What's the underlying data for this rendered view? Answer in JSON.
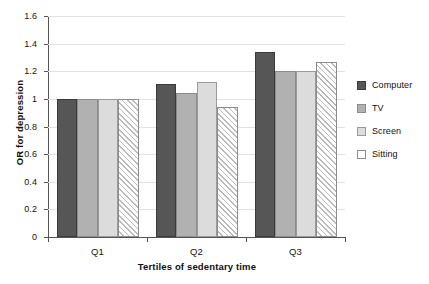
{
  "chart_data": {
    "type": "bar",
    "title": "",
    "subtitle": "",
    "xlabel": "Tertiles of sedentary time",
    "ylabel": "OR for depression",
    "categories": [
      "Q1",
      "Q2",
      "Q3"
    ],
    "series": [
      {
        "name": "Computer",
        "color": "#565656",
        "fill": "solid-dark-gray",
        "values": [
          1.0,
          1.11,
          1.34
        ]
      },
      {
        "name": "TV",
        "color": "#b1b1b1",
        "fill": "solid-medium-gray",
        "values": [
          1.0,
          1.04,
          1.2
        ]
      },
      {
        "name": "Screen",
        "color": "#dcdcdc",
        "fill": "solid-light-gray",
        "values": [
          1.0,
          1.12,
          1.2
        ]
      },
      {
        "name": "Sitting",
        "color": "#ffffff",
        "fill": "diagonal-hatch",
        "values": [
          1.0,
          0.94,
          1.27
        ]
      }
    ],
    "ylim": [
      0,
      1.6
    ],
    "ytick_labels": [
      "0",
      "0.2",
      "0.4",
      "0.6",
      "0.8",
      "1",
      "1.2",
      "1.4",
      "1.6"
    ],
    "ytick_values": [
      0,
      0.2,
      0.4,
      0.6,
      0.8,
      1.0,
      1.2,
      1.4,
      1.6
    ],
    "grid": "horizontal",
    "legend_position": "right",
    "legend_entries": [
      "Computer",
      "TV",
      "Screen",
      "Sitting"
    ]
  }
}
